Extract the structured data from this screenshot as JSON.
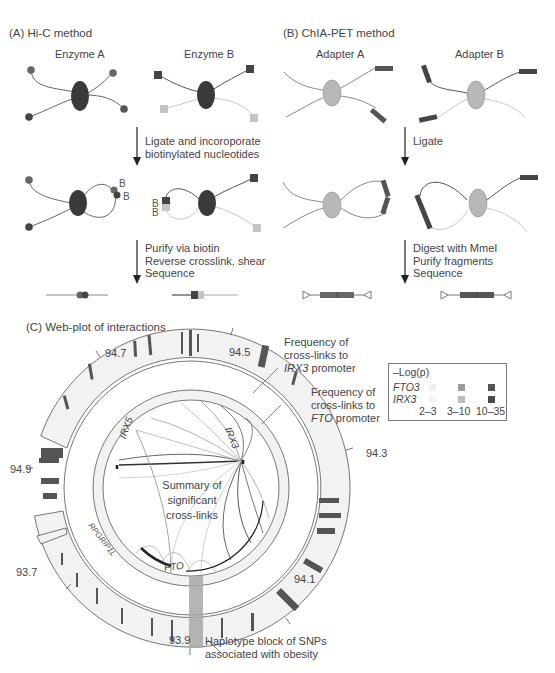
{
  "panel_a": {
    "title": "(A)  Hi-C method",
    "enzyme_a": "Enzyme A",
    "enzyme_b": "Enzyme B",
    "step1": "Ligate and incoroporate\nbiotinylated nucleotides",
    "step2": "Purify via biotin\nReverse crosslink, shear\nSequence",
    "biotin_label": "B"
  },
  "panel_b": {
    "title": "(B)  ChIA-PET method",
    "adapter_a": "Adapter A",
    "adapter_b": "Adapter B",
    "step1": "Ligate",
    "step2": "Digest with MmeI\nPurify fragments\nSequence"
  },
  "panel_c": {
    "title": "(C)  Web-plot of interactions",
    "tick_labels": [
      "94.7",
      "94.5",
      "94.3",
      "94.1",
      "93.9",
      "93.7",
      "94.9"
    ],
    "gene_labels": {
      "irx5": "IRX5",
      "irx3": "IRX3",
      "fto": "FTO",
      "rpgrip1l": "RPGRIP1L"
    },
    "center_label": "Summary of\nsignificant\ncross-links",
    "callout_irx3": {
      "line1": "Frequency of",
      "line2": "cross-links to",
      "gene": "IRX3",
      "suffix": " promoter"
    },
    "callout_fto": {
      "line1": "Frequency of",
      "line2": "cross-links to",
      "gene": "FTO",
      "suffix": " promoter"
    },
    "callout_haplotype": "Haplotype block of SNPs\nassociated with obesity",
    "legend": {
      "title": "–Log(p)",
      "rows": [
        {
          "label": "FTO3"
        },
        {
          "label": "IRX3"
        }
      ],
      "columns": [
        "2–3",
        "3–10",
        "10–35"
      ],
      "colors": {
        "fto": [
          "#f2f2f2",
          "#9a9a9a",
          "#555555"
        ],
        "irx": [
          "#f4f4f4",
          "#bdbdbd",
          "#4a4a4a"
        ]
      }
    }
  },
  "colors": {
    "dark_protein": "#3a3a3a",
    "light_protein": "#b8b8b8",
    "dark_strand": "#555555",
    "light_strand": "#c8c8c8",
    "ring_fill": "#f1f1f1",
    "haplotype": "#a8a8a8"
  }
}
